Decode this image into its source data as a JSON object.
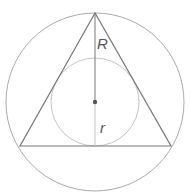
{
  "diagram": {
    "labels": {
      "circumradius": "R",
      "inradius": "r"
    },
    "colors": {
      "circumcircle": "#aaaaaa",
      "incircle": "#c4c4c4",
      "triangle": "#777777",
      "radius_line_upper": "#777777",
      "radius_line_lower": "#c4c4c4",
      "center_dot": "#555555",
      "label": "#555555"
    },
    "geometry": {
      "center": [
        95,
        102
      ],
      "circumradius_px": 89,
      "inradius_px": 44,
      "triangle_vertices": [
        [
          95,
          13
        ],
        [
          20,
          146
        ],
        [
          171,
          146
        ]
      ]
    }
  }
}
